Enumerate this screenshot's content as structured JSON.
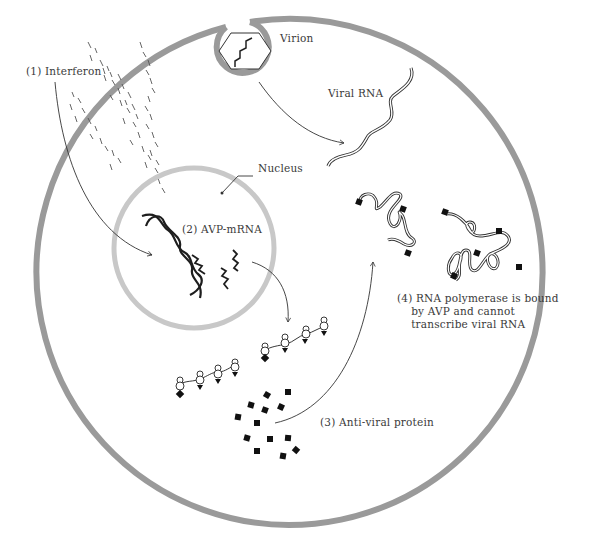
{
  "diagram": {
    "type": "biological-process",
    "colors": {
      "cell_membrane": "#9a9a9a",
      "nuclear_envelope": "#c8c8c8",
      "ink": "#222222",
      "label_text": "#3a3a3a",
      "background": "#ffffff"
    },
    "labels": {
      "interferon": "(1) Interferon",
      "virion": "Virion",
      "viral_rna": "Viral RNA",
      "nucleus": "Nucleus",
      "avp_mrna": "(2) AVP-mRNA",
      "anti_viral_protein": "(3) Anti-viral protein",
      "rna_polymerase": "(4) RNA polymerase is bound\n    by AVP and cannot\n    transcribe viral RNA"
    },
    "nodes": [
      {
        "id": "interferon",
        "label": "(1) Interferon"
      },
      {
        "id": "virion",
        "label": "Virion"
      },
      {
        "id": "viral_rna",
        "label": "Viral RNA"
      },
      {
        "id": "nucleus",
        "label": "Nucleus"
      },
      {
        "id": "avp_mrna",
        "label": "(2) AVP-mRNA"
      },
      {
        "id": "anti_viral_protein",
        "label": "(3) Anti-viral protein"
      },
      {
        "id": "rna_polymerase_bound",
        "label": "(4) RNA polymerase is bound by AVP and cannot transcribe viral RNA"
      }
    ],
    "edges": [
      {
        "from": "interferon",
        "to": "avp_mrna"
      },
      {
        "from": "virion",
        "to": "viral_rna"
      },
      {
        "from": "avp_mrna",
        "to": "ribosomes"
      },
      {
        "from": "anti_viral_protein",
        "to": "rna_polymerase_bound"
      }
    ]
  }
}
